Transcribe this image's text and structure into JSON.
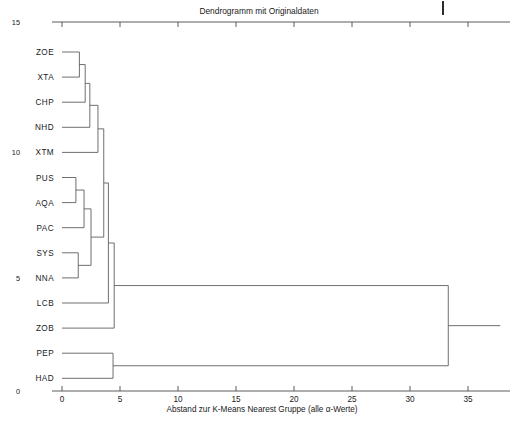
{
  "chart_data": {
    "type": "dendrogram",
    "title": "Dendrogramm mit Originaldaten",
    "xlabel": "Abstand zur K-Means Nearest Gruppe (alle α-Werte)",
    "ylabel": "",
    "xlim": [
      -0.6,
      39.0
    ],
    "xticks": [
      0,
      5,
      10,
      15,
      20,
      25,
      30,
      35
    ],
    "xticklabels": [
      "0",
      "5",
      "10",
      "15",
      "20",
      "25",
      "30",
      "35"
    ],
    "yticks": [
      0,
      5,
      10,
      15
    ],
    "yticklabels": [
      "0",
      "5",
      "10",
      "15"
    ],
    "grid": false,
    "legend": null,
    "orientation": "left",
    "leaves": [
      "ZOE",
      "XTA",
      "CHP",
      "NHD",
      "XTM",
      "PUS",
      "AQA",
      "PAC",
      "SYS",
      "NNA",
      "LCB",
      "ZOB",
      "PEP",
      "HAD"
    ],
    "merges": [
      {
        "id": "m1",
        "children": [
          "ZOE",
          "XTA"
        ],
        "distance": 1.5
      },
      {
        "id": "m2",
        "children": [
          "m1",
          "CHP"
        ],
        "distance": 2.0
      },
      {
        "id": "m3",
        "children": [
          "m2",
          "NHD"
        ],
        "distance": 2.4
      },
      {
        "id": "m4",
        "children": [
          "m3",
          "XTM"
        ],
        "distance": 3.1
      },
      {
        "id": "m5",
        "children": [
          "PUS",
          "AQA"
        ],
        "distance": 1.2
      },
      {
        "id": "m6",
        "children": [
          "m5",
          "PAC"
        ],
        "distance": 1.9
      },
      {
        "id": "m7",
        "children": [
          "SYS",
          "NNA"
        ],
        "distance": 1.4
      },
      {
        "id": "m8",
        "children": [
          "m6",
          "m7"
        ],
        "distance": 2.5
      },
      {
        "id": "m9",
        "children": [
          "m4",
          "m8"
        ],
        "distance": 3.6
      },
      {
        "id": "m10",
        "children": [
          "m9",
          "LCB"
        ],
        "distance": 4.0
      },
      {
        "id": "m11",
        "children": [
          "m10",
          "ZOB"
        ],
        "distance": 4.5
      },
      {
        "id": "m12",
        "children": [
          "PEP",
          "HAD"
        ],
        "distance": 4.4
      },
      {
        "id": "m13",
        "children": [
          "m11",
          "m12"
        ],
        "distance": 33.3
      }
    ]
  },
  "figure": {
    "title": "Dendrogramm mit Originaldaten",
    "xaxis_title": "Abstand zur K-Means Nearest Gruppe (alle α-Werte)",
    "line_color": "#555555",
    "axis_color": "#4a4a4a",
    "background": "#ffffff"
  }
}
